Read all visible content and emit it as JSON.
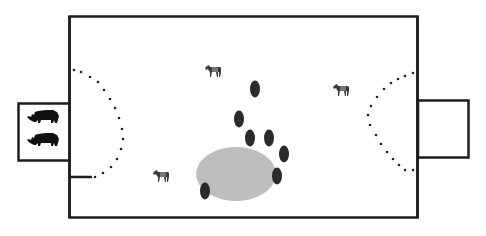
{
  "diagram": {
    "colors": {
      "background": "#ffffff",
      "stroke": "#1e1e1e",
      "dark_oval": "#2b2b2b",
      "grey_area": "#bdbdbd",
      "dots": "#222222"
    },
    "enclosure": {
      "x": 69,
      "y": 16,
      "w": 349,
      "h": 202
    },
    "left_pen": {
      "x": 18,
      "y": 103,
      "w": 51,
      "h": 58,
      "contents": [
        "rhino",
        "rhino"
      ]
    },
    "right_pen": {
      "x": 418,
      "y": 100,
      "w": 51,
      "h": 58,
      "contents": []
    },
    "left_stub_line": {
      "x1": 69,
      "y1": 177,
      "x2": 92,
      "y2": 177
    },
    "zebras": [
      {
        "x": 205,
        "y": 65
      },
      {
        "x": 153,
        "y": 170
      },
      {
        "x": 333,
        "y": 84
      }
    ],
    "grey_area": {
      "cx": 236,
      "cy": 174,
      "rx": 40,
      "ry": 27
    },
    "dark_ovals": [
      {
        "cx": 255,
        "cy": 89
      },
      {
        "cx": 239,
        "cy": 119
      },
      {
        "cx": 250,
        "cy": 138
      },
      {
        "cx": 269,
        "cy": 138
      },
      {
        "cx": 284,
        "cy": 154
      },
      {
        "cx": 277,
        "cy": 176
      },
      {
        "cx": 205,
        "cy": 191
      }
    ]
  }
}
